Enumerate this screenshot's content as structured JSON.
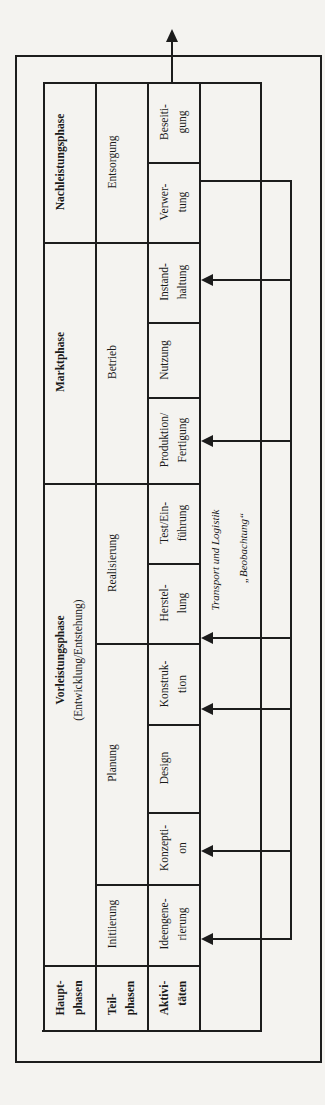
{
  "diagram": {
    "type": "product-lifecycle-phase-table",
    "orientation": "rotated-90-ccw",
    "row_headers": {
      "main_phases": [
        "Haupt-",
        "phasen"
      ],
      "sub_phases": [
        "Teil-",
        "phasen"
      ],
      "activities": [
        "Aktivi-",
        "täten"
      ]
    },
    "main_phases": [
      {
        "label": [
          "Vorleistungsphase",
          "(Entwicklung/Entstehung)"
        ]
      },
      {
        "label": [
          "Marktphase"
        ]
      },
      {
        "label": [
          "Nachleistungsphase"
        ]
      }
    ],
    "sub_phases": [
      {
        "label": "Initiierung"
      },
      {
        "label": "Planung"
      },
      {
        "label": "Realisierung"
      },
      {
        "label": "Betrieb"
      },
      {
        "label": "Entsorgung"
      }
    ],
    "activities": [
      {
        "label": [
          "Ideengene-",
          "rierung"
        ]
      },
      {
        "label": [
          "Konzepti-",
          "on"
        ]
      },
      {
        "label": [
          "Design"
        ]
      },
      {
        "label": [
          "Konstruk-",
          "tion"
        ]
      },
      {
        "label": [
          "Herstel-",
          "lung"
        ]
      },
      {
        "label": [
          "Test/Ein-",
          "führung"
        ]
      },
      {
        "label": [
          "Produktion/",
          "Fertigung"
        ]
      },
      {
        "label": [
          "Nutzung"
        ]
      },
      {
        "label": [
          "Instand-",
          "haltung"
        ]
      },
      {
        "label": [
          "Verwer-",
          "tung"
        ]
      },
      {
        "label": [
          "Beseiti-",
          "gung"
        ]
      }
    ],
    "feedback": {
      "line1": "Transport und Logistik",
      "line2": "„Beobachtung“",
      "source": "Verwertung",
      "targets": [
        "Ideengenerierung",
        "Konzeption",
        "Konstruktion",
        "Herstellung",
        "Produktion/Fertigung",
        "Instandhaltung"
      ]
    },
    "colors": {
      "line": "#1c1c1c",
      "background": "#f4f3f0"
    }
  }
}
